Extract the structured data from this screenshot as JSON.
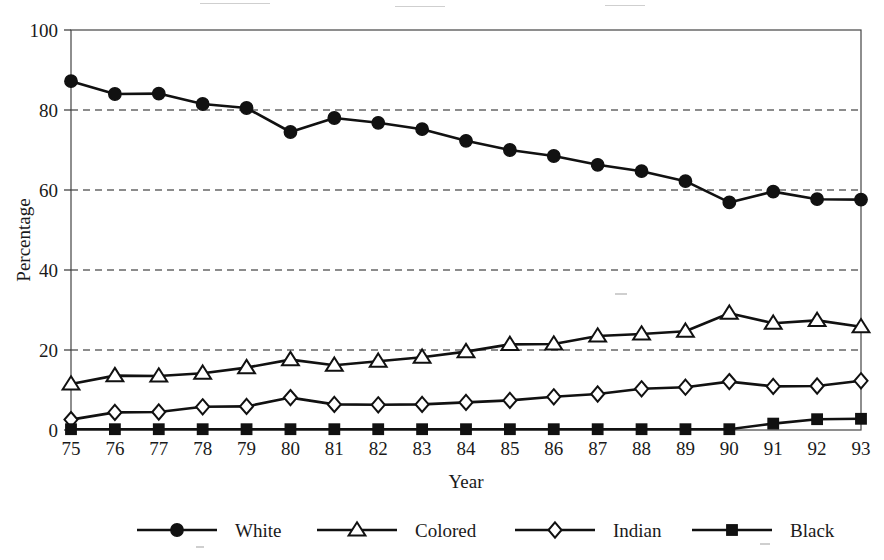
{
  "chart_data": {
    "type": "line",
    "title": "",
    "subtitle": "",
    "xlabel": "Year",
    "ylabel": "Percentage",
    "categories": [
      "75",
      "76",
      "77",
      "78",
      "79",
      "80",
      "81",
      "82",
      "83",
      "84",
      "85",
      "86",
      "87",
      "88",
      "89",
      "90",
      "91",
      "92",
      "93"
    ],
    "x": [
      75,
      76,
      77,
      78,
      79,
      80,
      81,
      82,
      83,
      84,
      85,
      86,
      87,
      88,
      89,
      90,
      91,
      92,
      93
    ],
    "xlim": [
      75,
      93
    ],
    "ylim": [
      0,
      100
    ],
    "yticks": [
      0,
      20,
      40,
      60,
      80,
      100
    ],
    "xticks": [
      "75",
      "76",
      "77",
      "78",
      "79",
      "80",
      "81",
      "82",
      "83",
      "84",
      "85",
      "86",
      "87",
      "88",
      "89",
      "90",
      "91",
      "92",
      "93"
    ],
    "grid": "horizontal-dashed",
    "legend_position": "bottom",
    "series": [
      {
        "name": "White",
        "marker": "filled-circle",
        "values": [
          87.2,
          84.0,
          84.1,
          81.5,
          80.5,
          74.5,
          78.0,
          76.8,
          75.2,
          72.3,
          70.0,
          68.5,
          66.3,
          64.7,
          62.2,
          56.9,
          59.6,
          57.7,
          57.6
        ]
      },
      {
        "name": "Colored",
        "marker": "open-triangle",
        "values": [
          11.5,
          13.6,
          13.5,
          14.2,
          15.6,
          17.6,
          16.2,
          17.2,
          18.2,
          19.6,
          21.4,
          21.5,
          23.5,
          24.0,
          24.7,
          29.2,
          26.7,
          27.4,
          25.8
        ]
      },
      {
        "name": "Indian",
        "marker": "open-diamond",
        "values": [
          2.6,
          4.4,
          4.5,
          5.8,
          5.9,
          8.1,
          6.4,
          6.3,
          6.4,
          6.9,
          7.4,
          8.3,
          9.0,
          10.3,
          10.7,
          12.1,
          10.9,
          11.0,
          12.3
        ]
      },
      {
        "name": "Black",
        "marker": "filled-square",
        "values": [
          0.2,
          0.2,
          0.2,
          0.2,
          0.2,
          0.2,
          0.2,
          0.2,
          0.2,
          0.2,
          0.2,
          0.2,
          0.2,
          0.2,
          0.2,
          0.2,
          1.6,
          2.7,
          2.8
        ]
      }
    ]
  },
  "legend": {
    "items": [
      {
        "label": "White",
        "marker": "filled-circle"
      },
      {
        "label": "Colored",
        "marker": "open-triangle"
      },
      {
        "label": "Indian",
        "marker": "open-diamond"
      },
      {
        "label": "Black",
        "marker": "filled-square"
      }
    ]
  },
  "colors": {
    "ink": "#111111",
    "frame": "#444444",
    "background": "#ffffff"
  }
}
